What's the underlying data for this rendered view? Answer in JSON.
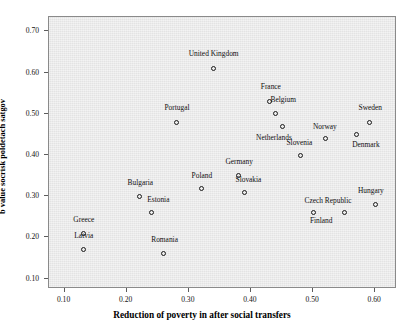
{
  "chart_data": {
    "type": "scatter",
    "title": "",
    "xlabel": "Reduction of poverty in after social transfers",
    "ylabel": "b value socrisk poldetach satgov",
    "xlim": [
      0.075,
      0.635
    ],
    "ylim": [
      0.075,
      0.735
    ],
    "xticks": [
      "0.10",
      "0.20",
      "0.30",
      "0.40",
      "0.50",
      "0.60"
    ],
    "xtick_values": [
      0.1,
      0.2,
      0.3,
      0.4,
      0.5,
      0.6
    ],
    "yticks": [
      "0.10",
      "0.20",
      "0.30",
      "0.40",
      "0.50",
      "0.60",
      "0.70"
    ],
    "ytick_values": [
      0.1,
      0.2,
      0.3,
      0.4,
      0.5,
      0.6,
      0.7
    ],
    "grid": false,
    "legend": "none",
    "marker": "open-circle",
    "panel_background": "#e9e9e9",
    "marker_color": "#1a1a1a",
    "points": [
      {
        "label": "United Kingdom",
        "x": 0.34,
        "y": 0.61,
        "lx": 0.34,
        "ly": 0.645,
        "anchor": "center"
      },
      {
        "label": "France",
        "x": 0.43,
        "y": 0.53,
        "lx": 0.432,
        "ly": 0.565,
        "anchor": "center"
      },
      {
        "label": "Belgium",
        "x": 0.44,
        "y": 0.5,
        "lx": 0.452,
        "ly": 0.533,
        "anchor": "center"
      },
      {
        "label": "Portugal",
        "x": 0.28,
        "y": 0.48,
        "lx": 0.281,
        "ly": 0.513,
        "anchor": "center"
      },
      {
        "label": "Sweden",
        "x": 0.59,
        "y": 0.48,
        "lx": 0.592,
        "ly": 0.513,
        "anchor": "center"
      },
      {
        "label": "Netherlands",
        "x": 0.45,
        "y": 0.47,
        "lx": 0.437,
        "ly": 0.442,
        "anchor": "center"
      },
      {
        "label": "Norway",
        "x": 0.52,
        "y": 0.44,
        "lx": 0.519,
        "ly": 0.468,
        "anchor": "center"
      },
      {
        "label": "Denmark",
        "x": 0.57,
        "y": 0.45,
        "lx": 0.585,
        "ly": 0.425,
        "anchor": "center"
      },
      {
        "label": "Slovenia",
        "x": 0.48,
        "y": 0.4,
        "lx": 0.478,
        "ly": 0.43,
        "anchor": "center"
      },
      {
        "label": "Germany",
        "x": 0.38,
        "y": 0.35,
        "lx": 0.381,
        "ly": 0.382,
        "anchor": "center"
      },
      {
        "label": "Poland",
        "x": 0.32,
        "y": 0.32,
        "lx": 0.321,
        "ly": 0.35,
        "anchor": "center"
      },
      {
        "label": "Slovakia",
        "x": 0.39,
        "y": 0.31,
        "lx": 0.396,
        "ly": 0.34,
        "anchor": "center"
      },
      {
        "label": "Bulgaria",
        "x": 0.22,
        "y": 0.3,
        "lx": 0.222,
        "ly": 0.333,
        "anchor": "center"
      },
      {
        "label": "Hungary",
        "x": 0.6,
        "y": 0.28,
        "lx": 0.593,
        "ly": 0.313,
        "anchor": "center"
      },
      {
        "label": "Czech Republic",
        "x": 0.55,
        "y": 0.26,
        "lx": 0.524,
        "ly": 0.288,
        "anchor": "center"
      },
      {
        "label": "Finland",
        "x": 0.5,
        "y": 0.26,
        "lx": 0.513,
        "ly": 0.24,
        "anchor": "center"
      },
      {
        "label": "Estonia",
        "x": 0.24,
        "y": 0.26,
        "lx": 0.251,
        "ly": 0.292,
        "anchor": "center"
      },
      {
        "label": "Greece",
        "x": 0.13,
        "y": 0.21,
        "lx": 0.131,
        "ly": 0.243,
        "anchor": "center"
      },
      {
        "label": "Latvia",
        "x": 0.13,
        "y": 0.17,
        "lx": 0.131,
        "ly": 0.203,
        "anchor": "center"
      },
      {
        "label": "Romania",
        "x": 0.26,
        "y": 0.16,
        "lx": 0.261,
        "ly": 0.193,
        "anchor": "center"
      }
    ]
  }
}
